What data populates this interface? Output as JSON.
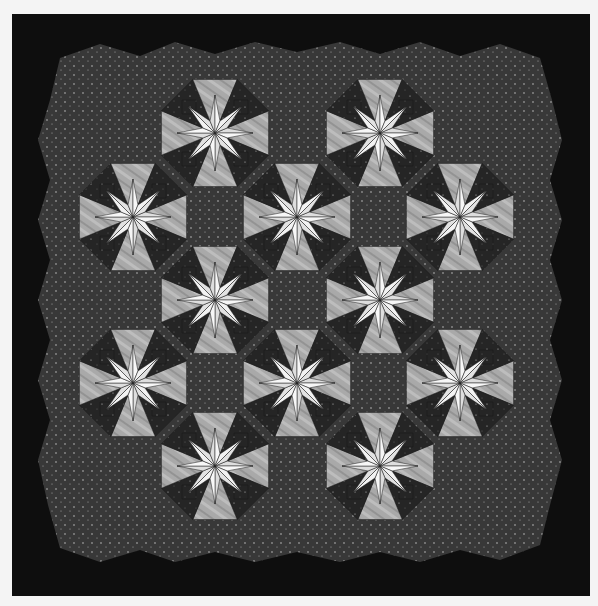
{
  "image": {
    "subject": "Eight-pointed star quilt",
    "description": "Black and white photograph of a quilt with white eight-pointed stars on checkerboard and kaleidoscope blocks, speckled dark background inside a black border",
    "colors": {
      "background": "#f4f4f4",
      "border": "#0d0d0d",
      "speckled_field": "#3a3a3a",
      "dark_patch": "#262626",
      "light_patch": "#a8a8a8",
      "star": "#ececec"
    },
    "stars": [
      {
        "cx": 215,
        "cy": 133
      },
      {
        "cx": 380,
        "cy": 133
      },
      {
        "cx": 133,
        "cy": 217
      },
      {
        "cx": 297,
        "cy": 217
      },
      {
        "cx": 460,
        "cy": 217
      },
      {
        "cx": 215,
        "cy": 300
      },
      {
        "cx": 380,
        "cy": 300
      },
      {
        "cx": 133,
        "cy": 383
      },
      {
        "cx": 297,
        "cy": 383
      },
      {
        "cx": 460,
        "cy": 383
      },
      {
        "cx": 215,
        "cy": 466
      },
      {
        "cx": 380,
        "cy": 466
      }
    ]
  }
}
